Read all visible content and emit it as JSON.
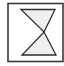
{
  "icon": {
    "name": "hourglass-icon",
    "frame_color": "#3a3a3a",
    "shape_stroke": "#2e2e2e",
    "shape_fill": "#f0f0f0",
    "background": "#ffffff"
  }
}
